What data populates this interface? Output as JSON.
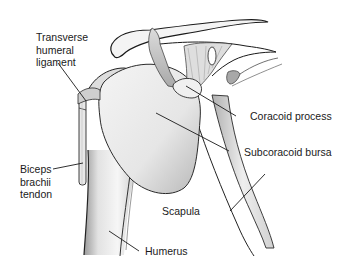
{
  "figure": {
    "background_color": "#ffffff",
    "line_color": "#1a1a1a",
    "labels": [
      {
        "id": "transverse-humeral-ligament",
        "lines": [
          "Transverse",
          "humeral",
          "ligament"
        ]
      },
      {
        "id": "coracoid-process",
        "lines": [
          "Coracoid process"
        ]
      },
      {
        "id": "subcoracoid-bursa",
        "lines": [
          "Subcoracoid bursa"
        ]
      },
      {
        "id": "biceps-brachii-tendon",
        "lines": [
          "Biceps",
          "brachii",
          "tendon"
        ]
      },
      {
        "id": "scapula",
        "lines": [
          "Scapula"
        ]
      },
      {
        "id": "humerus",
        "lines": [
          "Humerus"
        ]
      }
    ]
  }
}
